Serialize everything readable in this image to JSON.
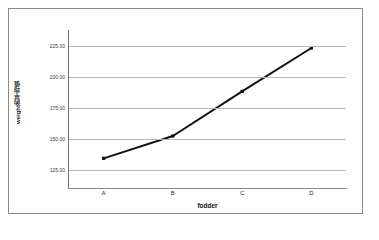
{
  "chart_data": {
    "type": "line",
    "title": "",
    "subtitle": "",
    "xlabel": "fodder",
    "ylabel": "weight的平均值",
    "categories": [
      "A",
      "B",
      "C",
      "D"
    ],
    "values": [
      134,
      152,
      188,
      223
    ],
    "series": [
      {
        "name": "weight的平均值",
        "values": [
          134,
          152,
          188,
          223
        ]
      }
    ],
    "ylim": [
      112.5,
      237.5
    ],
    "y_ticks": [
      125,
      150,
      175,
      200,
      225
    ],
    "y_tick_labels": [
      "125.00",
      "150.00",
      "175.00",
      "200.00",
      "225.00"
    ],
    "grid": true,
    "grid_axis": "y",
    "legend": false,
    "legend_position": "none",
    "markers": true,
    "line_color": "#111111",
    "grid_color": "#b9b9b9",
    "axis_color": "#6e6e6e",
    "frame_color": "#8a8a8a",
    "background": "#ffffff"
  },
  "axes": {
    "y": {
      "title": "weight的平均值",
      "ticks": [
        {
          "label": "225.00",
          "value": 225
        },
        {
          "label": "200.00",
          "value": 200
        },
        {
          "label": "175.00",
          "value": 175
        },
        {
          "label": "150.00",
          "value": 150
        },
        {
          "label": "125.00",
          "value": 125
        }
      ]
    },
    "x": {
      "title": "fodder",
      "ticks": [
        {
          "label": "A"
        },
        {
          "label": "B"
        },
        {
          "label": "C"
        },
        {
          "label": "D"
        }
      ]
    }
  }
}
